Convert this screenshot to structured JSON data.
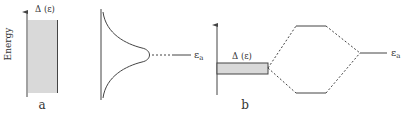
{
  "diagram": {
    "panel_a": {
      "label": "a",
      "axis_label": "Energy",
      "band_label": "Δ (ε)",
      "level_label": "ε",
      "level_subscript": "a"
    },
    "panel_b": {
      "label": "b",
      "band_label": "Δ (ε)",
      "level_label": "ε",
      "level_subscript": "a"
    },
    "colors": {
      "line": "#444444",
      "band_fill": "#d9d9d9",
      "background": "#ffffff"
    }
  }
}
